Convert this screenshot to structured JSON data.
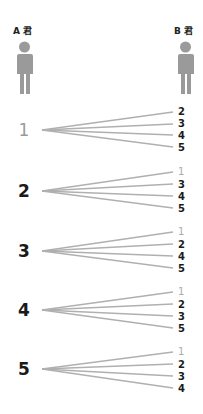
{
  "people": [
    {
      "label": "A 君",
      "id": "A"
    },
    {
      "label": "B 君",
      "id": "B"
    }
  ],
  "icon_color": "#9a9a9a",
  "line_color": "#b0b0b0",
  "groups": [
    {
      "a_choice": "1",
      "b_options": [
        "2",
        "3",
        "4",
        "5"
      ]
    },
    {
      "a_choice": "2",
      "b_options": [
        "1",
        "3",
        "4",
        "5"
      ]
    },
    {
      "a_choice": "3",
      "b_options": [
        "1",
        "2",
        "4",
        "5"
      ]
    },
    {
      "a_choice": "4",
      "b_options": [
        "1",
        "2",
        "3",
        "5"
      ]
    },
    {
      "a_choice": "5",
      "b_options": [
        "1",
        "2",
        "3",
        "4"
      ]
    }
  ]
}
